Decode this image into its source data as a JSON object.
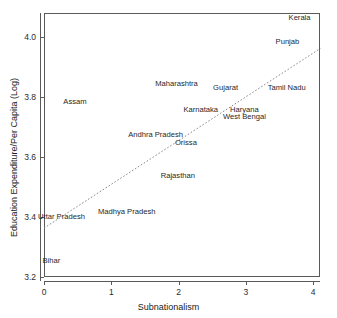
{
  "chart_data": {
    "type": "scatter",
    "title": "",
    "xlabel": "Subnationalism",
    "ylabel": "Education Expenditure/Per Capita (Log)",
    "xlim": [
      -0.1,
      4.15
    ],
    "ylim": [
      3.18,
      4.08
    ],
    "xticks": [
      0,
      1,
      2,
      3,
      4
    ],
    "xtick_labels": [
      "0",
      "1",
      "2",
      "3",
      "4"
    ],
    "yticks": [
      3.2,
      3.4,
      3.6,
      3.8,
      4.0
    ],
    "ytick_labels": [
      "3.2",
      "3.4",
      "3.6",
      "3.8",
      "4.0"
    ],
    "grid": false,
    "legend": "none",
    "marker_style": "text-labels-only",
    "points": [
      {
        "label": "Kerala",
        "x": 3.8,
        "y": 4.065
      },
      {
        "label": "Punjab",
        "x": 3.62,
        "y": 3.985
      },
      {
        "label": "Maharashtra",
        "x": 1.97,
        "y": 3.845
      },
      {
        "label": "Gujarat",
        "x": 2.7,
        "y": 3.83
      },
      {
        "label": "Tamil Nadu",
        "x": 3.61,
        "y": 3.83
      },
      {
        "label": "Assam",
        "x": 0.46,
        "y": 3.783
      },
      {
        "label": "Karnataka",
        "x": 2.33,
        "y": 3.757
      },
      {
        "label": "Haryana",
        "x": 2.98,
        "y": 3.757
      },
      {
        "label": "West Bengal",
        "x": 2.98,
        "y": 3.733
      },
      {
        "label": "Andhra Pradesh",
        "x": 1.66,
        "y": 3.675
      },
      {
        "label": "Orissa",
        "x": 2.11,
        "y": 3.648
      },
      {
        "label": "Rajasthan",
        "x": 1.99,
        "y": 3.537
      },
      {
        "label": "Madhya Pradesh",
        "x": 1.23,
        "y": 3.417
      },
      {
        "label": "Uttar Pradesh",
        "x": 0.26,
        "y": 3.4
      },
      {
        "label": "Bihar",
        "x": 0.11,
        "y": 3.255
      }
    ],
    "fit_line": {
      "style": "dotted",
      "color": "#8a8a8a",
      "x_start": 0.0,
      "y_start": 3.363,
      "x_end": 4.11,
      "y_end": 3.962
    },
    "axis_color": "#5a5a5a",
    "text_color": "#1f1f1f"
  }
}
